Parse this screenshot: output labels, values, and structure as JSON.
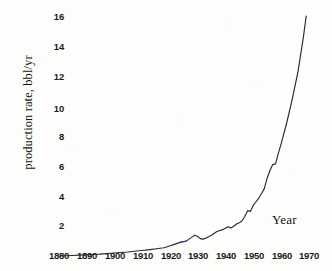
{
  "figure": {
    "caption_y": "production rate, bbl/yr",
    "caption_x": "Year"
  },
  "axes": {
    "y_ticks": [
      "16",
      "14",
      "12",
      "10",
      "8",
      "6",
      "4",
      "2"
    ],
    "x_ticks": [
      "1880",
      "1890",
      "1900",
      "1910",
      "1920",
      "1930",
      "1940",
      "1950",
      "1960",
      "1970"
    ]
  },
  "style": {
    "curve_color": "#2a2a2a",
    "artifact_color": "#3b3bbe",
    "paper_color": "#fdfdfc",
    "text_color": "#1a1a1a"
  },
  "chart_data": {
    "type": "line",
    "title": "",
    "xlabel": "Year",
    "ylabel": "production rate, bbl/yr",
    "xlim": [
      1880,
      1970
    ],
    "ylim": [
      0,
      16.6
    ],
    "grid": false,
    "legend": false,
    "x_tick_values": [
      1880,
      1890,
      1900,
      1910,
      1920,
      1930,
      1940,
      1950,
      1960,
      1970
    ],
    "y_tick_values": [
      2,
      4,
      6,
      8,
      10,
      12,
      14,
      16
    ],
    "series": [
      {
        "name": "world crude oil production rate",
        "x": [
          1880,
          1885,
          1890,
          1895,
          1900,
          1905,
          1910,
          1913,
          1916,
          1918,
          1920,
          1922,
          1924,
          1926,
          1928,
          1929,
          1930,
          1931,
          1932,
          1933,
          1935,
          1937,
          1939,
          1940,
          1941,
          1942,
          1943,
          1944,
          1945,
          1946,
          1947,
          1948,
          1949,
          1950,
          1951,
          1952,
          1953,
          1954,
          1955,
          1956,
          1957,
          1958,
          1959,
          1960,
          1962,
          1964,
          1966,
          1968,
          1969
        ],
        "y": [
          0.05,
          0.08,
          0.12,
          0.17,
          0.25,
          0.32,
          0.42,
          0.48,
          0.55,
          0.6,
          0.72,
          0.85,
          0.98,
          1.05,
          1.32,
          1.45,
          1.38,
          1.22,
          1.18,
          1.25,
          1.45,
          1.7,
          1.82,
          1.92,
          2.02,
          1.94,
          2.05,
          2.2,
          2.28,
          2.42,
          2.72,
          3.1,
          3.05,
          3.45,
          3.7,
          3.95,
          4.25,
          4.6,
          5.3,
          5.8,
          6.2,
          6.25,
          6.95,
          7.6,
          9.0,
          10.6,
          12.4,
          14.8,
          16.2
        ]
      }
    ],
    "annotations": [
      {
        "text": "Year",
        "x": 1962,
        "y": 2.1,
        "role": "axis-caption"
      }
    ]
  }
}
